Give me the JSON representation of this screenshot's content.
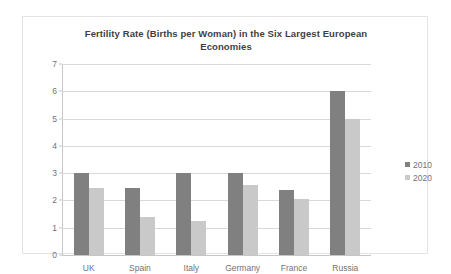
{
  "chart_data": {
    "type": "bar",
    "title": "Fertility Rate (Births per Woman) in the Six Largest European Economies",
    "title_line1": "Fertility Rate (Births per Woman) in the Six Largest European",
    "title_line2": "Economies",
    "xlabel": "",
    "ylabel": "",
    "ylim": [
      0,
      7
    ],
    "yticks": [
      0,
      1,
      2,
      3,
      4,
      5,
      6,
      7
    ],
    "ytick_labels": [
      "0",
      "1",
      "2",
      "3",
      "4",
      "5",
      "6",
      "7"
    ],
    "grid": true,
    "legend_position": "right",
    "categories": [
      "UK",
      "Spain",
      "Italy",
      "Germany",
      "France",
      "Russia"
    ],
    "series": [
      {
        "name": "2010",
        "color": "#808080",
        "values": [
          3.0,
          2.45,
          3.0,
          3.0,
          2.4,
          6.0
        ]
      },
      {
        "name": "2020",
        "color": "#c9c9c9",
        "values": [
          2.45,
          1.4,
          1.25,
          2.55,
          2.05,
          5.0
        ]
      }
    ]
  },
  "colors": {
    "series_2010": "#808080",
    "series_2020": "#c9c9c9",
    "gridline": "#d9d9d9",
    "axis": "#c6c6c6",
    "border": "#e3e3e3",
    "title_text": "#3f3f3f",
    "tick_text": "#737373",
    "background": "#ffffff"
  }
}
